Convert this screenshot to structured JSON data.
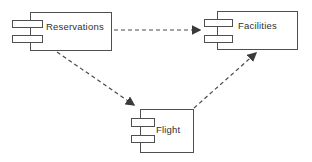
{
  "diagram": {
    "kind": "uml-component-diagram",
    "components": [
      {
        "name": "Reservations"
      },
      {
        "name": "Facilities"
      },
      {
        "name": "Flight"
      }
    ],
    "connections": [
      {
        "from": "Reservations",
        "to": "Facilities",
        "line_style": "dashed",
        "arrowhead": "filled-triangle"
      },
      {
        "from": "Reservations",
        "to": "Flight",
        "line_style": "dashed",
        "arrowhead": "filled-triangle"
      },
      {
        "from": "Flight",
        "to": "Facilities",
        "line_style": "dashed",
        "arrowhead": "filled-triangle"
      }
    ],
    "colors": {
      "background": "#ffffff",
      "line": "#4a4a4a",
      "text": "#2f2f2f"
    }
  }
}
